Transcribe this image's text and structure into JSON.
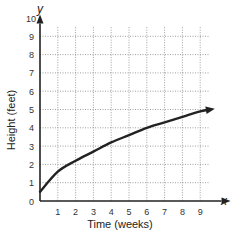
{
  "chart_data": {
    "type": "line",
    "title": "",
    "xlabel": "Time (weeks)",
    "ylabel": "Height (feet)",
    "x_axis_var": "x",
    "y_axis_var": "y",
    "xlim": [
      0,
      10
    ],
    "ylim": [
      0,
      10
    ],
    "x_ticks": [
      "1",
      "2",
      "3",
      "4",
      "5",
      "6",
      "7",
      "8",
      "9"
    ],
    "y_ticks": [
      "0",
      "1",
      "2",
      "3",
      "4",
      "5",
      "6",
      "7",
      "8",
      "9",
      "10"
    ],
    "grid": true,
    "grid_style": "dotted",
    "series": [
      {
        "name": "height",
        "x": [
          0,
          1,
          2,
          3,
          4,
          5,
          6,
          7,
          8,
          9,
          9.6
        ],
        "values": [
          0.5,
          1.6,
          2.2,
          2.7,
          3.2,
          3.6,
          4.0,
          4.3,
          4.6,
          4.9,
          5.0
        ],
        "end_arrow": true
      }
    ],
    "colors": {
      "axis": "#222222",
      "curve": "#222222",
      "grid": "#888888"
    }
  }
}
